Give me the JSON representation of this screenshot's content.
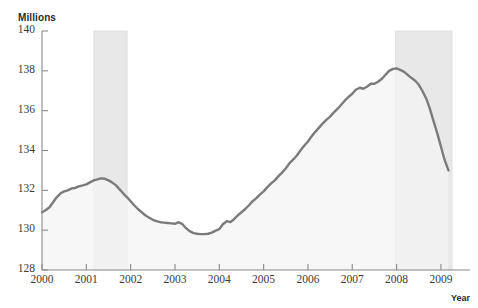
{
  "chart_data": {
    "type": "line",
    "title": "",
    "ylabel": "Millions",
    "xlabel": "Year",
    "xlim": [
      2000,
      2009.25
    ],
    "ylim": [
      128,
      140
    ],
    "grid": false,
    "legend": null,
    "yticks": [
      128,
      130,
      132,
      134,
      136,
      138,
      140
    ],
    "ytick_labels": [
      "128",
      "130",
      "132",
      "134",
      "136",
      "138",
      "140"
    ],
    "xticks": [
      2000,
      2001,
      2002,
      2003,
      2004,
      2005,
      2006,
      2007,
      2008,
      2009
    ],
    "xtick_labels": [
      "2000",
      "2001",
      "2002",
      "2003",
      "2004",
      "2005",
      "2006",
      "2007",
      "2008",
      "2009"
    ],
    "series": [
      {
        "name": "Employment",
        "color": "#7b7b7b",
        "x": [
          2000.0,
          2000.08,
          2000.17,
          2000.25,
          2000.33,
          2000.42,
          2000.5,
          2000.58,
          2000.67,
          2000.75,
          2000.83,
          2000.92,
          2001.0,
          2001.08,
          2001.17,
          2001.25,
          2001.33,
          2001.42,
          2001.5,
          2001.58,
          2001.67,
          2001.75,
          2001.83,
          2001.92,
          2002.0,
          2002.08,
          2002.17,
          2002.25,
          2002.33,
          2002.42,
          2002.5,
          2002.58,
          2002.67,
          2002.75,
          2002.83,
          2002.92,
          2003.0,
          2003.08,
          2003.17,
          2003.25,
          2003.33,
          2003.42,
          2003.5,
          2003.58,
          2003.67,
          2003.75,
          2003.83,
          2003.92,
          2004.0,
          2004.08,
          2004.17,
          2004.25,
          2004.33,
          2004.42,
          2004.5,
          2004.58,
          2004.67,
          2004.75,
          2004.83,
          2004.92,
          2005.0,
          2005.08,
          2005.17,
          2005.25,
          2005.33,
          2005.42,
          2005.5,
          2005.58,
          2005.67,
          2005.75,
          2005.83,
          2005.92,
          2006.0,
          2006.08,
          2006.17,
          2006.25,
          2006.33,
          2006.42,
          2006.5,
          2006.58,
          2006.67,
          2006.75,
          2006.83,
          2006.92,
          2007.0,
          2007.08,
          2007.17,
          2007.25,
          2007.33,
          2007.42,
          2007.5,
          2007.58,
          2007.67,
          2007.75,
          2007.83,
          2007.92,
          2008.0,
          2008.08,
          2008.17,
          2008.25,
          2008.33,
          2008.42,
          2008.5,
          2008.58,
          2008.67,
          2008.75,
          2008.83,
          2008.92,
          2009.0,
          2009.08,
          2009.17
        ],
        "y": [
          130.9,
          131.0,
          131.15,
          131.4,
          131.65,
          131.85,
          131.95,
          132.0,
          132.1,
          132.12,
          132.2,
          132.25,
          132.3,
          132.4,
          132.5,
          132.55,
          132.6,
          132.58,
          132.5,
          132.4,
          132.25,
          132.05,
          131.85,
          131.65,
          131.45,
          131.25,
          131.05,
          130.9,
          130.75,
          130.62,
          130.52,
          130.45,
          130.4,
          130.38,
          130.36,
          130.34,
          130.32,
          130.4,
          130.3,
          130.1,
          129.95,
          129.85,
          129.82,
          129.8,
          129.8,
          129.82,
          129.88,
          129.98,
          130.05,
          130.3,
          130.45,
          130.4,
          130.55,
          130.75,
          130.9,
          131.05,
          131.25,
          131.45,
          131.6,
          131.8,
          131.95,
          132.15,
          132.35,
          132.5,
          132.7,
          132.9,
          133.1,
          133.35,
          133.55,
          133.75,
          134.0,
          134.25,
          134.45,
          134.7,
          134.95,
          135.15,
          135.35,
          135.55,
          135.7,
          135.9,
          136.1,
          136.3,
          136.5,
          136.7,
          136.85,
          137.05,
          137.15,
          137.1,
          137.2,
          137.35,
          137.35,
          137.45,
          137.6,
          137.8,
          138.0,
          138.1,
          138.12,
          138.05,
          137.95,
          137.8,
          137.65,
          137.5,
          137.3,
          137.0,
          136.6,
          136.1,
          135.5,
          134.85,
          134.2,
          133.55,
          133.0
        ]
      }
    ],
    "shaded_regions": [
      {
        "name": "recession-2001",
        "start": 2001.17,
        "end": 2001.92,
        "color": "#e8e8e8"
      },
      {
        "name": "recession-2008",
        "start": 2007.98,
        "end": 2009.25,
        "color": "#e8e8e8"
      }
    ],
    "axis_color": "#8a8a8a",
    "line_color": "#7b7b7b",
    "fill_color": "#f4f4f4"
  }
}
